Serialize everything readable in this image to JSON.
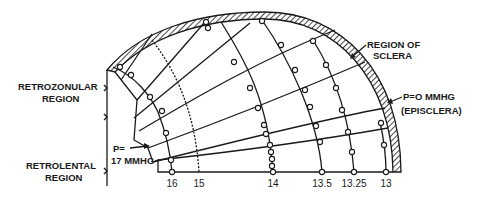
{
  "diagram": {
    "type": "finite-element mesh of eye cross-section (pressure contours)",
    "labels": {
      "region_sclera_1": "REGION OF",
      "region_sclera_2": "SCLERA",
      "episclera_1": "P=O MMHG",
      "episclera_2": "(EPISCLERA)",
      "retrozonular_1": "RETROZONULAR",
      "retrozonular_2": "REGION",
      "retrolental_1": "RETROLENTAL",
      "retrolental_2": "REGION",
      "p17_1": "P=",
      "p17_2": "17 MMHG"
    },
    "isobar_ticks": [
      {
        "label": "16",
        "x": 172
      },
      {
        "label": "15",
        "x": 199
      },
      {
        "label": "14",
        "x": 273
      },
      {
        "label": "13.5",
        "x": 322
      },
      {
        "label": "13.25",
        "x": 354
      },
      {
        "label": "13",
        "x": 386
      }
    ],
    "colors": {
      "ink": "#1a1a1a",
      "background": "#ffffff"
    }
  }
}
